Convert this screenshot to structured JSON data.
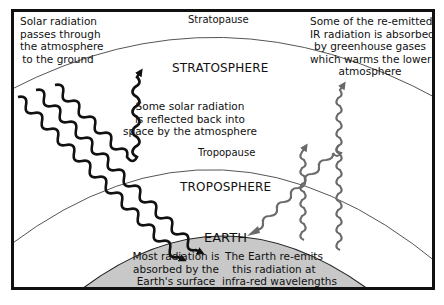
{
  "diagram": {
    "colors": {
      "frame": "#111111",
      "layer_line": "#555555",
      "earth_fill": "#c8c8c8",
      "solar_arrow": "#111111",
      "ir_arrow": "#6a6a6a",
      "text": "#111111"
    },
    "layers": {
      "stratopause": "Stratopause",
      "stratosphere": "STRATOSPHERE",
      "tropopause": "Tropopause",
      "troposphere": "TROPOSPHERE",
      "earth": "EARTH"
    },
    "annotations": {
      "solar_incoming": [
        "Solar radiation",
        "passes through",
        "the atmosphere",
        "to the ground"
      ],
      "reflected": [
        "Some solar radiation",
        "is reflected back into",
        "space by the atmosphere"
      ],
      "absorbed_ir": [
        "Some of the re-emitted",
        "IR radiation is absorbed",
        "by greenhouse gases",
        "which warms the lower",
        "atmosphere"
      ],
      "surface_absorb": [
        "Most radiation is",
        "absorbed by the",
        "Earth's surface"
      ],
      "re_emit": [
        "The Earth re-emits",
        "this radiation at",
        "infra-red wavelengths"
      ]
    },
    "arrows": [
      {
        "name": "solar-incoming-arrow-1",
        "type": "solar",
        "direction": "down-right"
      },
      {
        "name": "solar-incoming-arrow-2",
        "type": "solar",
        "direction": "down-right"
      },
      {
        "name": "solar-reflected-arrow",
        "type": "solar",
        "direction": "down-then-up"
      },
      {
        "name": "ir-emitted-arrow-1",
        "type": "infrared",
        "direction": "up-right"
      },
      {
        "name": "ir-emitted-arrow-2",
        "type": "infrared",
        "direction": "up-right"
      },
      {
        "name": "ir-emitted-arrow-3",
        "type": "infrared",
        "direction": "up-right"
      }
    ]
  }
}
